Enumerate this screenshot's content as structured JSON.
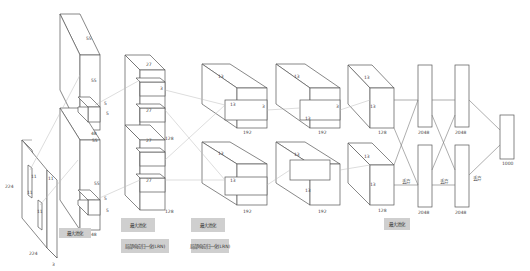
{
  "diagram": {
    "layers": [
      {
        "id": "input",
        "labels": {
          "height": "224",
          "width": "224",
          "depth": "3",
          "kernel_top": "11",
          "kernel_top_side": "11",
          "kernel_bottom": "11",
          "kernel_bottom_side": "11"
        }
      },
      {
        "id": "conv1",
        "labels": {
          "top_width": "55",
          "top_height": "55",
          "top_depth": "48",
          "bottom_width": "55",
          "bottom_height": "55",
          "bottom_depth": "48",
          "k1": "5",
          "k2": "5",
          "k3": "5",
          "k4": "5"
        }
      },
      {
        "id": "conv2",
        "labels": {
          "w1": "27",
          "w2": "27",
          "w3": "27",
          "w4": "27",
          "k": "3",
          "depth_top": "128",
          "depth_bottom": "128"
        }
      },
      {
        "id": "conv3",
        "labels": {
          "w_top": "13",
          "h_top": "13",
          "w_bottom": "13",
          "h_bottom": "13",
          "k": "3",
          "depth_top": "192",
          "depth_bottom": "192"
        }
      },
      {
        "id": "conv4",
        "labels": {
          "w_top": "13",
          "h_top": "13",
          "w_bottom": "13",
          "h_bottom": "13",
          "k": "3",
          "depth_top": "192",
          "depth_bottom": "192"
        }
      },
      {
        "id": "conv5",
        "labels": {
          "w_top": "13",
          "h_top": "13",
          "w_bottom": "13",
          "h_bottom": "13",
          "depth_top": "128",
          "depth_bottom": "128"
        }
      },
      {
        "id": "fc6",
        "labels": {
          "top": "2048",
          "bottom": "2048"
        }
      },
      {
        "id": "fc7",
        "labels": {
          "top": "2048",
          "bottom": "2048"
        }
      },
      {
        "id": "fc8",
        "labels": {
          "out": "1000"
        }
      }
    ],
    "tags": {
      "conv1_pool": "最大池化",
      "conv2_pool": "最大池化",
      "conv2_lrn": "局部响应归一化(LRN)",
      "conv3_pool": "最大池化",
      "conv3_lrn": "局部响应归一化(LRN)",
      "conv5_pool": "最大池化",
      "dropout1": "丢弃",
      "dropout2": "丢弃",
      "dropout3": "丢弃"
    }
  }
}
